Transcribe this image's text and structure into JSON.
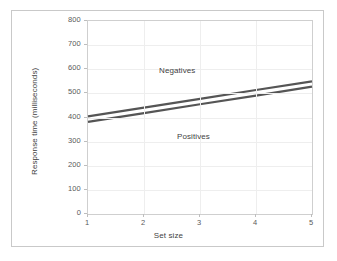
{
  "figure": {
    "background_color": "#ffffff",
    "frame_color": "#c9c9c9",
    "axis_color": "#cfcfcf",
    "grid_color": "#eeeeee"
  },
  "chart_data": {
    "type": "line",
    "title": "",
    "xlabel": "Set size",
    "ylabel": "Response time (milliseconds)",
    "x": [
      1,
      2,
      3,
      4,
      5
    ],
    "xlim": [
      1,
      5
    ],
    "ylim": [
      0,
      800
    ],
    "xticks": [
      "1",
      "2",
      "3",
      "4",
      "5"
    ],
    "yticks": [
      "0",
      "100",
      "200",
      "300",
      "400",
      "500",
      "600",
      "700",
      "800"
    ],
    "grid": true,
    "legend_position": "inline-annotation",
    "series": [
      {
        "name": "Negatives",
        "color": "#555555",
        "values": [
          405,
          441,
          477,
          514,
          550
        ],
        "annotation": "Negatives"
      },
      {
        "name": "Positives",
        "color": "#555555",
        "values": [
          382,
          418,
          455,
          491,
          528
        ],
        "annotation": "Positives"
      }
    ]
  }
}
